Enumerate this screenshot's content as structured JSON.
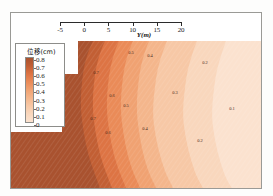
{
  "figure": {
    "background_color": "#ffffff",
    "frame_color": "#9a9a96"
  },
  "axis": {
    "label": "Y(m)",
    "ticks": [
      "-5",
      "0",
      "5",
      "10",
      "15",
      "20"
    ],
    "tick_values": [
      -5,
      0,
      5,
      10,
      15,
      20
    ],
    "range": [
      -5,
      20
    ],
    "position": "top"
  },
  "legend": {
    "title": "位移(cm)",
    "labels": [
      "0.8",
      "0.7",
      "0.6",
      "0.5",
      "0.4",
      "0.3",
      "0.2",
      "0.1",
      "0"
    ],
    "values": [
      0.8,
      0.7,
      0.6,
      0.5,
      0.4,
      0.3,
      0.2,
      0.1,
      0
    ]
  },
  "chart_data": {
    "type": "heatmap",
    "subtype": "filled-contour",
    "title": "",
    "xlabel": "Y(m)",
    "ylabel": "",
    "xlim": [
      -5,
      20
    ],
    "grid": false,
    "legend_position": "left-inset",
    "colorbar_title": "位移(cm)",
    "levels": [
      0,
      0.1,
      0.2,
      0.3,
      0.4,
      0.5,
      0.6,
      0.7,
      0.8
    ],
    "level_colors": [
      "#fbe2cf",
      "#f9d7bd",
      "#f7c8a6",
      "#f4b68c",
      "#f0a272",
      "#ea8b58",
      "#dd7444",
      "#c25f34",
      "#a9522f"
    ],
    "contour_labels": [
      "0.7",
      "0.6",
      "0.5",
      "0.4",
      "0.3",
      "0.2",
      "0.1"
    ]
  },
  "contour_annotations": [
    {
      "label": "0.7",
      "x": 96,
      "y": 72
    },
    {
      "label": "0.7",
      "x": 93,
      "y": 118
    },
    {
      "label": "0.6",
      "x": 112,
      "y": 95
    },
    {
      "label": "0.6",
      "x": 108,
      "y": 132
    },
    {
      "label": "0.5",
      "x": 131,
      "y": 52
    },
    {
      "label": "0.5",
      "x": 126,
      "y": 105
    },
    {
      "label": "0.4",
      "x": 150,
      "y": 55
    },
    {
      "label": "0.4",
      "x": 145,
      "y": 128
    },
    {
      "label": "0.3",
      "x": 175,
      "y": 92
    },
    {
      "label": "0.2",
      "x": 205,
      "y": 62
    },
    {
      "label": "0.2",
      "x": 200,
      "y": 140
    },
    {
      "label": "0.1",
      "x": 232,
      "y": 108
    }
  ]
}
